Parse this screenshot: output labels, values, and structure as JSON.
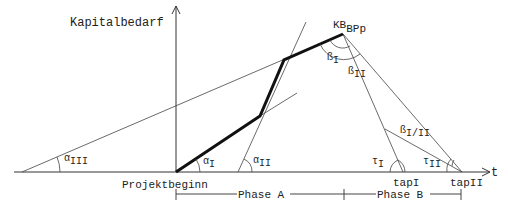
{
  "labels": {
    "y_axis": "Kapitalbedarf",
    "x_axis": "t",
    "peak": "KB",
    "peak_sub": "BPp",
    "origin": "Projektbeginn",
    "tap1": "tapI",
    "tap2": "tapII",
    "phase_a": "Phase A",
    "phase_b": "Phase B"
  },
  "angles": {
    "alpha": "α",
    "beta": "ß",
    "tau": "τ",
    "alpha_I": "I",
    "alpha_II": "II",
    "alpha_III": "III",
    "beta_I": "I",
    "beta_II": "II",
    "beta_I_II": "I/II",
    "tau_I": "I",
    "tau_II": "II"
  }
}
